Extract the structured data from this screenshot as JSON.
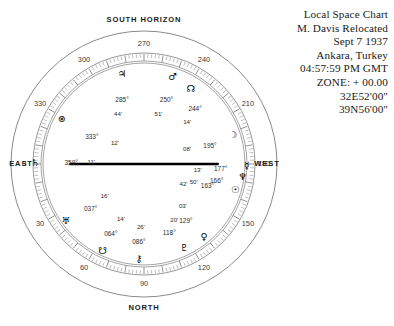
{
  "header": {
    "lines": [
      "Local Space Chart",
      "M. Davis Relocated",
      "Sept 7 1937",
      "Ankara, Turkey",
      "04:57:59 PM GMT",
      "ZONE: + 00.00",
      "32E52'00\"",
      "39N56'00\""
    ]
  },
  "cardinals": {
    "top": "SOUTH  HORIZON",
    "bottom": "NORTH",
    "left": "EAST",
    "right": "WEST"
  },
  "chart_data": {
    "type": "scatter",
    "title": "Local Space Chart",
    "subtitle": "M. Davis Relocated",
    "coordinate_system": "azimuth-degrees",
    "axis_labels": {
      "0": "EAST",
      "90": "NORTH",
      "180": "WEST",
      "270": "SOUTH  HORIZON"
    },
    "ring_ticks": [
      "0",
      "30",
      "60",
      "90",
      "120",
      "150",
      "180",
      "210",
      "240",
      "270",
      "300",
      "330"
    ],
    "ring_tick_values": [
      0,
      30,
      60,
      90,
      120,
      150,
      180,
      210,
      240,
      270,
      300,
      330
    ],
    "grid": true,
    "legend": "none",
    "bodies": [
      {
        "name": "saturn",
        "glyph": "♄",
        "deg": "359°",
        "min": "11'",
        "azimuth": 359.18,
        "radius": 0.78,
        "glyph_dx": -30,
        "glyph_dy": 0,
        "deg_dx": 6,
        "deg_dy": 0,
        "min_dx": 26,
        "min_dy": 0
      },
      {
        "name": "part-of-fortune",
        "glyph": "⊗",
        "deg": "333°",
        "min": "12'",
        "azimuth": 333.2,
        "radius": 0.8,
        "glyph_dx": -10,
        "glyph_dy": -9,
        "deg_dx": 20,
        "deg_dy": 10,
        "min_dx": 43,
        "min_dy": 16
      },
      {
        "name": "jupiter",
        "glyph": "♃",
        "deg": "285°",
        "min": "44'",
        "azimuth": 285.73,
        "radius": 0.8,
        "glyph_dx": 0,
        "glyph_dy": -12,
        "deg_dx": 0,
        "deg_dy": 14,
        "min_dx": -4,
        "min_dy": 28
      },
      {
        "name": "mars",
        "glyph": "♂",
        "deg": "250°",
        "min": "51'",
        "azimuth": 250.85,
        "radius": 0.8,
        "glyph_dx": 2,
        "glyph_dy": -11,
        "deg_dx": -4,
        "deg_dy": 13,
        "min_dx": -12,
        "min_dy": 27
      },
      {
        "name": "north-node",
        "glyph": "☊",
        "deg": "244°",
        "min": "14'",
        "azimuth": 244.23,
        "radius": 0.8,
        "glyph_dx": 12,
        "glyph_dy": -2,
        "deg_dx": 16,
        "deg_dy": 18,
        "min_dx": 8,
        "min_dy": 31
      },
      {
        "name": "moon",
        "glyph": "☽",
        "deg": "195°",
        "min": "08'",
        "azimuth": 195.13,
        "radius": 0.8,
        "glyph_dx": 11,
        "glyph_dy": -8,
        "deg_dx": -12,
        "deg_dy": 3,
        "min_dx": -35,
        "min_dy": 6
      },
      {
        "name": "mercury",
        "glyph": "☿",
        "deg": "177°",
        "min": "13'",
        "azimuth": 177.22,
        "radius": 0.8,
        "glyph_dx": 22,
        "glyph_dy": -2,
        "deg_dx": -4,
        "deg_dy": 1,
        "min_dx": -27,
        "min_dy": 2
      },
      {
        "name": "neptune",
        "glyph": "♆",
        "deg": "166°",
        "min": "50'",
        "azimuth": 166.83,
        "radius": 0.8,
        "glyph_dx": 20,
        "glyph_dy": -5,
        "deg_dx": -6,
        "deg_dy": -1,
        "min_dx": -29,
        "min_dy": 0
      },
      {
        "name": "sun",
        "glyph": "☉",
        "deg": "163°",
        "min": "42'",
        "azimuth": 163.7,
        "radius": 0.8,
        "glyph_dx": 14,
        "glyph_dy": 3,
        "deg_dx": -14,
        "deg_dy": 0,
        "min_dx": -38,
        "min_dy": -2
      },
      {
        "name": "venus",
        "glyph": "♀",
        "deg": "129°",
        "min": "03'",
        "azimuth": 129.05,
        "radius": 0.8,
        "glyph_dx": 9,
        "glyph_dy": 10,
        "deg_dx": -9,
        "deg_dy": -5,
        "min_dx": -12,
        "min_dy": -20
      },
      {
        "name": "pluto",
        "glyph": "♇",
        "deg": "118°",
        "min": "20'",
        "azimuth": 118.33,
        "radius": 0.8,
        "glyph_dx": 2,
        "glyph_dy": 13,
        "deg_dx": -13,
        "deg_dy": -2,
        "min_dx": -8,
        "min_dy": -15
      },
      {
        "name": "chiron",
        "glyph": "⚷",
        "deg": "086°",
        "min": "26'",
        "azimuth": 86.43,
        "radius": 0.8,
        "glyph_dx": 0,
        "glyph_dy": 14,
        "deg_dx": 0,
        "deg_dy": -2,
        "min_dx": 2,
        "min_dy": -17
      },
      {
        "name": "south-node",
        "glyph": "☋",
        "deg": "064°",
        "min": "14'",
        "azimuth": 64.23,
        "radius": 0.8,
        "glyph_dx": -6,
        "glyph_dy": 14,
        "deg_dx": 2,
        "deg_dy": -2,
        "min_dx": 12,
        "min_dy": -17
      },
      {
        "name": "uranus",
        "glyph": "♅",
        "deg": "037°",
        "min": "16'",
        "azimuth": 37.27,
        "radius": 0.8,
        "glyph_dx": -14,
        "glyph_dy": 8,
        "deg_dx": 11,
        "deg_dy": -4,
        "min_dx": 25,
        "min_dy": -17
      }
    ],
    "horizon_line": {
      "from_azimuth": 0,
      "to_azimuth": 180,
      "extent": 0.74
    }
  }
}
